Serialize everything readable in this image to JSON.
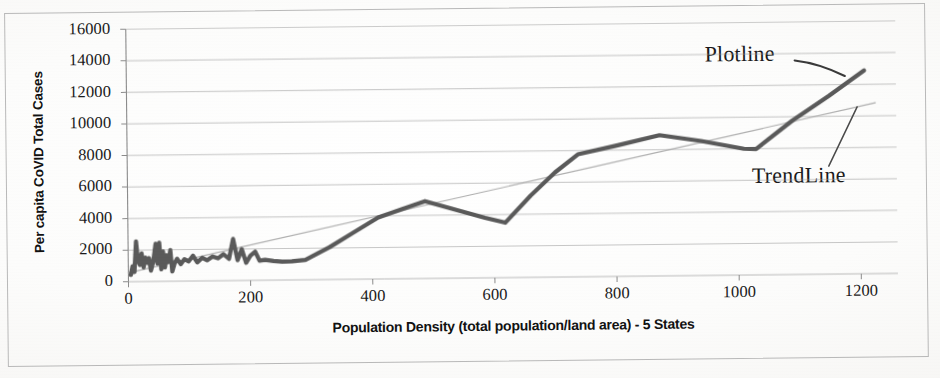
{
  "figure": {
    "kind": "scanned-excel-chart",
    "background_color": "#fbfbfa",
    "frame_color": "#b9b9b9"
  },
  "annotations": [
    {
      "id": "plotline",
      "label": "Plotline"
    },
    {
      "id": "trendline",
      "label": "TrendLine"
    }
  ],
  "chart_data": {
    "type": "line",
    "title": "",
    "xlabel": "Population Density (total population/land area) - 5 States",
    "ylabel": "Per capita CoVID Total Cases",
    "xlim": [
      0,
      1260
    ],
    "ylim": [
      0,
      16000
    ],
    "xticks": [
      0,
      200,
      400,
      600,
      800,
      1000,
      1200
    ],
    "xtick_labels": [
      "0",
      "200",
      "400",
      "600",
      "800",
      "1000",
      "1200"
    ],
    "yticks": [
      0,
      2000,
      4000,
      6000,
      8000,
      10000,
      12000,
      14000,
      16000
    ],
    "ytick_labels": [
      "0",
      "2000",
      "4000",
      "6000",
      "8000",
      "10000",
      "12000",
      "14000",
      "16000"
    ],
    "grid": true,
    "grid_axis": "y",
    "grid_color": "#9a9a9a",
    "legend": false,
    "series": [
      {
        "name": "Plotline",
        "role": "data",
        "color": "#5a5a5a",
        "width": 4.2,
        "points": [
          [
            4,
            430
          ],
          [
            7,
            980
          ],
          [
            10,
            610
          ],
          [
            13,
            2550
          ],
          [
            16,
            1300
          ],
          [
            19,
            1050
          ],
          [
            22,
            1780
          ],
          [
            25,
            900
          ],
          [
            28,
            1520
          ],
          [
            31,
            1180
          ],
          [
            34,
            1480
          ],
          [
            37,
            690
          ],
          [
            41,
            1270
          ],
          [
            45,
            2380
          ],
          [
            48,
            1120
          ],
          [
            51,
            2450
          ],
          [
            54,
            760
          ],
          [
            57,
            1900
          ],
          [
            60,
            880
          ],
          [
            63,
            1650
          ],
          [
            66,
            1230
          ],
          [
            69,
            1980
          ],
          [
            72,
            620
          ],
          [
            76,
            1150
          ],
          [
            80,
            1420
          ],
          [
            86,
            1080
          ],
          [
            92,
            1390
          ],
          [
            99,
            1250
          ],
          [
            106,
            1600
          ],
          [
            113,
            1180
          ],
          [
            121,
            1460
          ],
          [
            129,
            1300
          ],
          [
            138,
            1540
          ],
          [
            147,
            1420
          ],
          [
            156,
            1680
          ],
          [
            165,
            1380
          ],
          [
            172,
            2640
          ],
          [
            179,
            1290
          ],
          [
            186,
            1980
          ],
          [
            193,
            1120
          ],
          [
            200,
            1560
          ],
          [
            208,
            1820
          ],
          [
            215,
            1240
          ],
          [
            224,
            1290
          ],
          [
            238,
            1210
          ],
          [
            252,
            1160
          ],
          [
            268,
            1180
          ],
          [
            290,
            1260
          ],
          [
            330,
            2050
          ],
          [
            370,
            2980
          ],
          [
            410,
            3900
          ],
          [
            450,
            4420
          ],
          [
            487,
            4900
          ],
          [
            545,
            4250
          ],
          [
            585,
            3800
          ],
          [
            618,
            3480
          ],
          [
            660,
            5180
          ],
          [
            700,
            6620
          ],
          [
            738,
            7760
          ],
          [
            800,
            8280
          ],
          [
            872,
            8920
          ],
          [
            940,
            8520
          ],
          [
            1010,
            8000
          ],
          [
            1030,
            7980
          ],
          [
            1090,
            9760
          ],
          [
            1150,
            11300
          ],
          [
            1208,
            12880
          ]
        ]
      },
      {
        "name": "TrendLine",
        "role": "trend",
        "color": "#aeaeae",
        "width": 1.2,
        "endpoints": [
          [
            0,
            560
          ],
          [
            1226,
            10830
          ]
        ]
      }
    ]
  },
  "axis_titles": {
    "y": "Per capita CoVID Total Cases",
    "x": "Population Density (total population/land area) - 5 States"
  }
}
